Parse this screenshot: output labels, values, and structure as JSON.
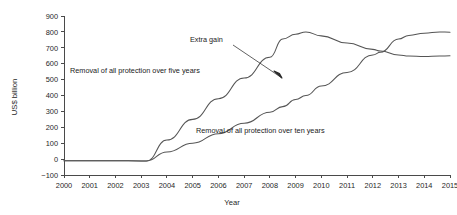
{
  "chart_data": {
    "type": "line",
    "title": "",
    "xlabel": "Year",
    "ylabel": "US$ billion",
    "xlim": [
      2000,
      2015
    ],
    "ylim": [
      -100,
      900
    ],
    "grid": false,
    "legend_position": "inline-annotations",
    "x_tick_labels": [
      "2000",
      "2001",
      "2002",
      "2003",
      "2004",
      "2005",
      "2006",
      "2007",
      "2008",
      "2009",
      "2010",
      "2011",
      "2012",
      "2013",
      "2014",
      "2015"
    ],
    "y_tick_labels": [
      "-100",
      "0",
      "100",
      "200",
      "300",
      "400",
      "500",
      "600",
      "700",
      "800",
      "900"
    ],
    "y_ticks": [
      -100,
      0,
      100,
      200,
      300,
      400,
      500,
      600,
      700,
      800,
      900
    ],
    "x": [
      2000,
      2001,
      2002,
      2003,
      2003.2,
      2004,
      2005,
      2006,
      2007,
      2008,
      2008.5,
      2009,
      2009.4,
      2010,
      2011,
      2012,
      2012.3,
      2013,
      2013.4,
      2014,
      2014.6,
      2015
    ],
    "series": [
      {
        "name": "Removal of all protection over five years",
        "color": "#555555",
        "values": [
          -10,
          -10,
          -10,
          -12,
          -12,
          120,
          250,
          380,
          510,
          640,
          755,
          785,
          800,
          775,
          730,
          690,
          680,
          655,
          648,
          645,
          648,
          650
        ]
      },
      {
        "name": "Removal of all protection over ten years",
        "color": "#555555",
        "values": [
          -10,
          -10,
          -10,
          -12,
          -12,
          45,
          100,
          160,
          225,
          295,
          330,
          375,
          400,
          460,
          545,
          655,
          672,
          755,
          778,
          792,
          800,
          798
        ]
      }
    ],
    "annotations": [
      {
        "text": "Extra gain",
        "x": 2009,
        "y": 830,
        "note": "arrow pointing down-right to gap between curves"
      },
      {
        "text": "Removal of all protection over five years",
        "x": 2004,
        "y": 520
      },
      {
        "text": "Removal of all protection over ten years",
        "x": 2010,
        "y": 210
      }
    ]
  },
  "labels": {
    "y_axis_title": "US$ billion",
    "x_axis_title": "Year",
    "extra_gain": "Extra gain",
    "five_years": "Removal of all protection over five years",
    "ten_years": "Removal of all protection over ten years"
  }
}
